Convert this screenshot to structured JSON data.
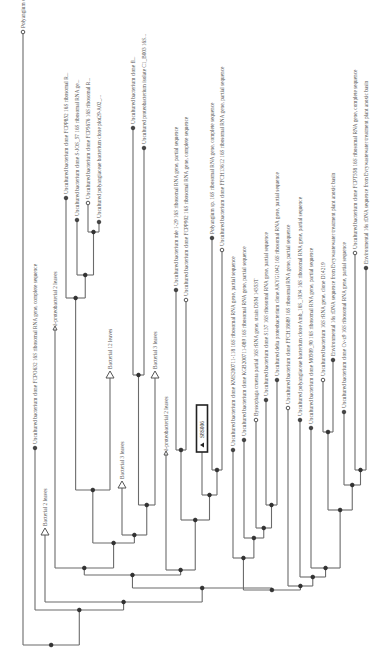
{
  "diagram": {
    "type": "phylogenetic-tree",
    "orientation": "rotated-90-ccw (root bottom-left, leaves up)",
    "highlight": {
      "label": "S8S006",
      "marker": "triangle"
    },
    "leaves": [
      {
        "id": "L1",
        "label": "Polyangium cellulosum strain NUST_6 16S ribosomal R",
        "kind": "leaf"
      },
      {
        "id": "L2",
        "label": "Uncultured bacterium clone FCPO632 16S ribosomal RNA gene, complete sequence",
        "kind": "leaf"
      },
      {
        "id": "L3",
        "label": "Bacterial 2 leaves",
        "kind": "collapsed"
      },
      {
        "id": "L4",
        "label": "δ-proteobacterial 2 leaves",
        "kind": "collapsed-small"
      },
      {
        "id": "L5",
        "label": "Uncultured bacterium clone FCPP852 16S ribosomal R...",
        "kind": "leaf"
      },
      {
        "id": "L6",
        "label": "Uncultured bacterium clone S-JOS_57 16S ribosomal RNA ge...",
        "kind": "leaf"
      },
      {
        "id": "L7",
        "label": "Uncultured bacterium clone FCP5676 16S ribosomal R...",
        "kind": "leaf"
      },
      {
        "id": "L8",
        "label": "Uncultured polyangiaceae bacterium clone plot29-A02_...",
        "kind": "leaf"
      },
      {
        "id": "L9",
        "label": "Bacterial 12 leaves",
        "kind": "collapsed"
      },
      {
        "id": "L10",
        "label": "Bacterial 3 leaves",
        "kind": "collapsed"
      },
      {
        "id": "L11",
        "label": "Uncultured bacterium clone fl...",
        "kind": "leaf"
      },
      {
        "id": "L12",
        "label": "Uncultured proteobacterium isolate C1_B003 16S...",
        "kind": "leaf"
      },
      {
        "id": "L13",
        "label": "Bacterial 3 leaves",
        "kind": "collapsed"
      },
      {
        "id": "L14",
        "label": "δ-proteobacterial 2 leaves",
        "kind": "collapsed-small"
      },
      {
        "id": "L15",
        "label": "Uncultured bacterium mle 1-29 16S ribosomal RNA gene, partial sequence",
        "kind": "leaf"
      },
      {
        "id": "L16",
        "label": "Uncultured bacterium clone FCPP902 16S ribosomal RNA gene, complete sequence",
        "kind": "leaf"
      },
      {
        "id": "L17",
        "label": "S8S006",
        "kind": "query"
      },
      {
        "id": "L18",
        "label": "Polyangium sp. 16S ribosomal RNA gene, complete sequence",
        "kind": "leaf"
      },
      {
        "id": "L19",
        "label": "Uncultured bacterium clone FFCH13612 16S ribosomal RNA gene, partial sequence",
        "kind": "leaf"
      },
      {
        "id": "L20",
        "label": "Uncultured bacterium clone KMS200711-118 16S ribosomal RNA gene, partial sequence",
        "kind": "leaf"
      },
      {
        "id": "L21",
        "label": "Uncultured bacterium clone KGB200711-089 16S ribosomal RNA gene, partial sequence",
        "kind": "leaf"
      },
      {
        "id": "L22",
        "label": "Byssophaga cruenta partial 16S rRNA gene, strain DSM 14553T",
        "kind": "leaf"
      },
      {
        "id": "L23",
        "label": "Uncultured bacterium clone S137 16S ribosomal RNA gene, partial sequence",
        "kind": "leaf"
      },
      {
        "id": "L24",
        "label": "Uncultured delta proteobacterium clone AKYG1042 16S ribosomal RNA gene, partial sequence",
        "kind": "leaf"
      },
      {
        "id": "L25",
        "label": "Uncultured bacterium clone FFCH18689 16S ribosomal RNA gene, partial sequence",
        "kind": "leaf"
      },
      {
        "id": "L26",
        "label": "Uncultured polyangiaceae bacterium clone Amb_16S_1034 16S ribosomal RNA gene, partial sequence",
        "kind": "leaf"
      },
      {
        "id": "L27",
        "label": "Uncultured bacterium clone M0509_90 16S ribosomal RNA gene, partial sequence",
        "kind": "leaf"
      },
      {
        "id": "L28",
        "label": "Uncultured bacterium 16S rRNA gene, clone D14219",
        "kind": "leaf"
      },
      {
        "id": "L29",
        "label": "Environmental 16s rDNA sequence from Evrywastewater treatment plant anoxic basin",
        "kind": "leaf"
      },
      {
        "id": "L30",
        "label": "Uncultured bacterium clone Cv-z9 16S ribosomal RNA gene, partial sequence",
        "kind": "leaf"
      },
      {
        "id": "L31",
        "label": "Uncultured bacterium clone FCPT558 16S ribosomal RNA gene, complete sequence",
        "kind": "leaf"
      },
      {
        "id": "L32",
        "label": "Environmental 16s rDNA sequence from Evrywastewater treatment plant anoxic basin",
        "kind": "leaf"
      }
    ]
  }
}
